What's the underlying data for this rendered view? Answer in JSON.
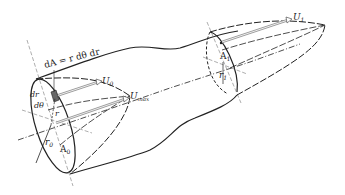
{
  "diagram": {
    "type": "fluid-flow stream tube with velocity profiles",
    "labels": {
      "area_element": "dA = r dθ dr",
      "dr": "dr",
      "dtheta": "dθ",
      "r": "r",
      "r0": "r",
      "r0_sub": "0",
      "A0": "A",
      "A0_sub": "0",
      "U0": "U",
      "U0_sub": "0",
      "Umax": "U",
      "Umax_sub": "max",
      "A1": "A",
      "A1_sub": "1",
      "r1": "r",
      "r1_sub": "1",
      "U1": "U",
      "U1_sub": "1"
    },
    "colors": {
      "line": "#222222",
      "arrow": "#999999",
      "background": "#ffffff"
    }
  }
}
